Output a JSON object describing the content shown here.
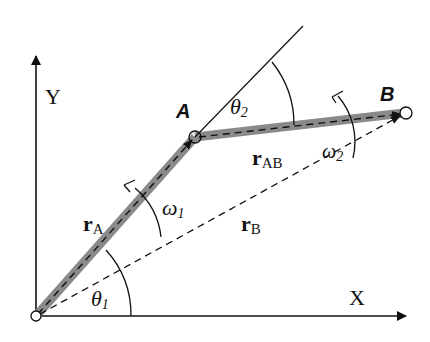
{
  "diagram": {
    "type": "two-link planar mechanism kinematics",
    "axes": {
      "x_label": "X",
      "y_label": "Y"
    },
    "points": {
      "origin": {
        "x": 36,
        "y": 316
      },
      "A": {
        "x": 195,
        "y": 137,
        "label": "A"
      },
      "B": {
        "x": 404,
        "y": 113,
        "label": "B"
      }
    },
    "links": {
      "link1": {
        "from": "origin",
        "to": "A",
        "color": "#8a8a8a"
      },
      "link2": {
        "from": "A",
        "to": "B",
        "color": "#8a8a8a"
      }
    },
    "vectors": {
      "rA": {
        "main": "r",
        "sub": "A"
      },
      "rAB": {
        "main": "r",
        "sub": "AB"
      },
      "rB": {
        "main": "r",
        "sub": "B"
      }
    },
    "angles": {
      "theta1": {
        "main": "θ",
        "sub": "1"
      },
      "theta2": {
        "main": "θ",
        "sub": "2"
      }
    },
    "angular_velocities": {
      "omega1": {
        "main": "ω",
        "sub": "1"
      },
      "omega2": {
        "main": "ω",
        "sub": "2"
      }
    },
    "colors": {
      "line": "#111111",
      "link": "#8a8a8a",
      "background": "#ffffff"
    }
  }
}
